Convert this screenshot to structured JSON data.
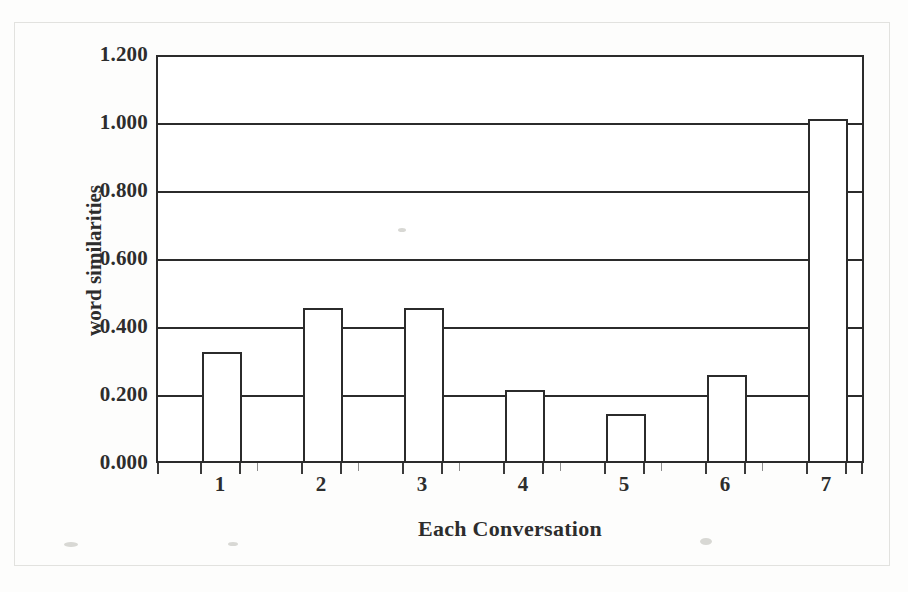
{
  "chart_data": {
    "type": "bar",
    "title": "",
    "xlabel": "Each Conversation",
    "ylabel": "word similarities",
    "categories": [
      "1",
      "2",
      "3",
      "4",
      "5",
      "6",
      "7"
    ],
    "values": [
      0.325,
      0.455,
      0.455,
      0.21,
      0.14,
      0.255,
      1.015
    ],
    "ylim": [
      0.0,
      1.2
    ],
    "ytick_labels": [
      "0.000",
      "0.200",
      "0.400",
      "0.600",
      "0.800",
      "1.000",
      "1.200"
    ],
    "ytick_values": [
      0.0,
      0.2,
      0.4,
      0.6,
      0.8,
      1.0,
      1.2
    ],
    "grid": "horizontal",
    "legend": "none",
    "series": [
      {
        "name": "word similarities",
        "values": [
          0.325,
          0.455,
          0.455,
          0.21,
          0.14,
          0.255,
          1.015
        ]
      }
    ],
    "bar_style": {
      "fill": "#ffffff",
      "edge": "#2b2b2b"
    }
  },
  "axes": {
    "y": {
      "label": "word similarities",
      "ticks": [
        {
          "label": "1.200",
          "value": 1.2
        },
        {
          "label": "1.000",
          "value": 1.0
        },
        {
          "label": "0.800",
          "value": 0.8
        },
        {
          "label": "0.600",
          "value": 0.6
        },
        {
          "label": "0.400",
          "value": 0.4
        },
        {
          "label": "0.200",
          "value": 0.2
        },
        {
          "label": "0.000",
          "value": 0.0
        }
      ]
    },
    "x": {
      "label": "Each Conversation",
      "ticks": [
        {
          "label": "1"
        },
        {
          "label": "2"
        },
        {
          "label": "3"
        },
        {
          "label": "4"
        },
        {
          "label": "5"
        },
        {
          "label": "6"
        },
        {
          "label": "7"
        }
      ]
    }
  },
  "colors": {
    "ink": "#2b2b2b",
    "paper": "#fdfdfc",
    "grid": "#2b2b2b"
  }
}
